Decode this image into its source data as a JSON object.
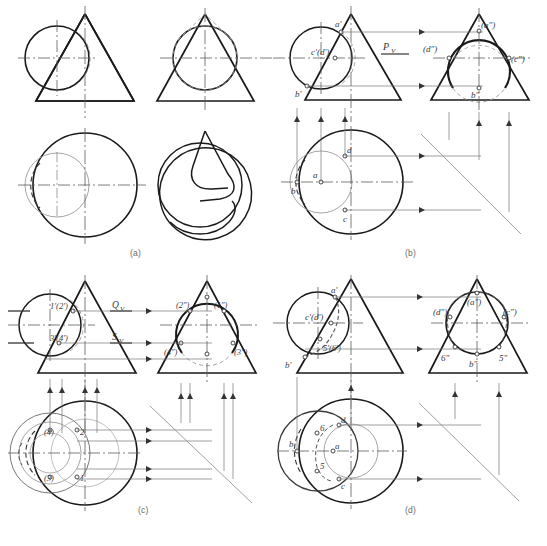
{
  "figure": {
    "panel_captions": [
      "(a)",
      "(b)",
      "(c)",
      "(d)"
    ]
  },
  "panels": {
    "a": {
      "caption": "(a)",
      "views": [
        "front-view",
        "side-view",
        "top-view",
        "pictorial-view"
      ],
      "labels": []
    },
    "b": {
      "caption": "(b)",
      "front_labels": [
        "a'",
        "c'(d')",
        "b'",
        "Pᵥ"
      ],
      "side_labels": [
        "(a″)",
        "(d″)",
        "(c″)",
        "b″"
      ],
      "top_labels": [
        "d",
        "a",
        "b",
        "c"
      ]
    },
    "c": {
      "caption": "(c)",
      "front_labels": [
        "1'(2')",
        "3'(4')",
        "Qᵥ",
        "Sᵥ"
      ],
      "side_labels": [
        "(2″)",
        "(1″)",
        "(4″)",
        "(3″)"
      ],
      "top_labels": [
        "(4)",
        "2",
        "(3)",
        "1"
      ]
    },
    "d": {
      "caption": "(d)",
      "front_labels": [
        "a'",
        "c'(d')",
        "b'",
        "5'(6')"
      ],
      "side_labels": [
        "(a″)",
        "(d″)",
        "(c″)",
        "6″",
        "b″",
        "5″"
      ],
      "top_labels": [
        "d",
        "6",
        "b",
        "a",
        "5",
        "c"
      ]
    }
  },
  "colors": {
    "outline": "#1a1a1a",
    "construction": "#555555",
    "centerline": "#5a5a5a",
    "hidden": "#444444",
    "caption": "#6a6a6a",
    "background": "#ffffff"
  }
}
